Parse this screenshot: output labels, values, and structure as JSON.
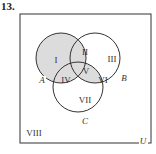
{
  "problem": {
    "number": "13."
  },
  "diagram": {
    "type": "venn-3-set",
    "universe_label": "U",
    "sets": [
      {
        "label": "A",
        "cx": 61,
        "cy": 58,
        "r": 25
      },
      {
        "label": "B",
        "cx": 95,
        "cy": 58,
        "r": 25
      },
      {
        "label": "C",
        "cx": 78,
        "cy": 87,
        "r": 25
      }
    ],
    "regions": [
      {
        "label": "I",
        "shaded": true
      },
      {
        "label": "II",
        "shaded": true
      },
      {
        "label": "III",
        "shaded": false
      },
      {
        "label": "IV",
        "shaded": true
      },
      {
        "label": "V",
        "shaded": true
      },
      {
        "label": "VI",
        "shaded": true
      },
      {
        "label": "VII",
        "shaded": false
      },
      {
        "label": "VIII",
        "shaded": false
      }
    ],
    "colors": {
      "shade": "#dcdcdc",
      "stroke": "#333333",
      "background": "#ffffff"
    }
  }
}
